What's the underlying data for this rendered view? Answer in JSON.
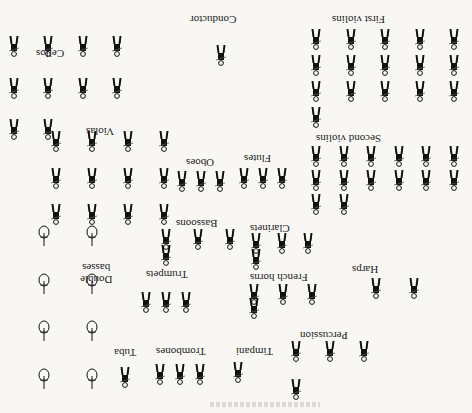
{
  "diagram": {
    "orientation": "rotated-180",
    "colors": {
      "ink": "#111111",
      "paper": "#f8f7f4",
      "bass_outline": "#222222"
    }
  },
  "sections": [
    {
      "key": "conductor",
      "label": "Conductor",
      "count": 1,
      "label_pos": [
        208,
        18
      ],
      "area": [
        206,
        30,
        30,
        50
      ]
    },
    {
      "key": "first_violins",
      "label": "First violins",
      "count": 16,
      "label_pos": [
        332,
        14
      ],
      "area": [
        310,
        28,
        150,
        100
      ]
    },
    {
      "key": "second_violins",
      "label": "Second violins",
      "count": 14,
      "label_pos": [
        310,
        136
      ],
      "area": [
        310,
        145,
        150,
        70
      ]
    },
    {
      "key": "cellos",
      "label": "Cellos",
      "count": 10,
      "label_pos": [
        36,
        50
      ],
      "area": [
        8,
        35,
        115,
        105
      ]
    },
    {
      "key": "violas",
      "label": "Violas",
      "count": 12,
      "label_pos": [
        86,
        126
      ],
      "area": [
        50,
        130,
        120,
        95
      ]
    },
    {
      "key": "double_basses",
      "label": "Double\nbasses",
      "count": 8,
      "label_pos": [
        80,
        256
      ],
      "area": [
        38,
        225,
        60,
        165
      ]
    },
    {
      "key": "oboes",
      "label": "Oboes",
      "count": 3,
      "label_pos": [
        186,
        157
      ],
      "area": [
        176,
        166,
        50,
        30
      ]
    },
    {
      "key": "flutes",
      "label": "Flutes",
      "count": 3,
      "label_pos": [
        244,
        153
      ],
      "area": [
        238,
        162,
        50,
        32
      ]
    },
    {
      "key": "bassoons",
      "label": "Bassoons",
      "count": 4,
      "label_pos": [
        172,
        218
      ],
      "area": [
        160,
        228,
        76,
        38
      ]
    },
    {
      "key": "clarinets",
      "label": "Clarinets",
      "count": 4,
      "label_pos": [
        248,
        223
      ],
      "area": [
        250,
        232,
        64,
        38
      ]
    },
    {
      "key": "harps",
      "label": "Harps",
      "count": 2,
      "label_pos": [
        352,
        266
      ],
      "area": [
        370,
        258,
        50,
        60
      ]
    },
    {
      "key": "trumpets",
      "label": "Trumpets",
      "count": 3,
      "label_pos": [
        144,
        269
      ],
      "area": [
        140,
        285,
        52,
        34
      ]
    },
    {
      "key": "french_horns",
      "label": "French horns",
      "count": 4,
      "label_pos": [
        250,
        272
      ],
      "area": [
        248,
        283,
        70,
        36
      ]
    },
    {
      "key": "percussion",
      "label": "Percussion",
      "count": 4,
      "label_pos": [
        298,
        330
      ],
      "area": [
        290,
        340,
        80,
        60
      ]
    },
    {
      "key": "timpani",
      "label": "Timpani",
      "count": 1,
      "label_pos": [
        234,
        346
      ],
      "area": [
        232,
        356,
        40,
        32
      ]
    },
    {
      "key": "trombones",
      "label": "Trombones",
      "count": 3,
      "label_pos": [
        152,
        346
      ],
      "area": [
        154,
        358,
        52,
        32
      ]
    },
    {
      "key": "tuba",
      "label": "Tuba",
      "count": 1,
      "label_pos": [
        114,
        347
      ],
      "area": [
        114,
        360,
        22,
        34
      ]
    }
  ]
}
